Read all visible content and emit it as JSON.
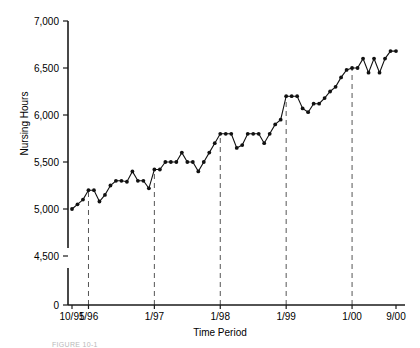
{
  "figure": {
    "caption": "FIGURE 10-1"
  },
  "chart_data": {
    "type": "line",
    "title": "",
    "xlabel": "Time Period",
    "ylabel": "Nursing Hours",
    "grid": false,
    "legend": null,
    "axis_break": true,
    "ylim": [
      4250,
      7000
    ],
    "yticks": [
      0,
      4500,
      5000,
      5500,
      6000,
      6500,
      7000
    ],
    "ytick_labels": [
      "0",
      "4,500",
      "5,000",
      "5,500",
      "6,000",
      "6,500",
      "7,000"
    ],
    "xtick_labels": [
      "10/95",
      "1/96",
      "1/97",
      "1/98",
      "1/99",
      "1/00",
      "9/00"
    ],
    "xtick_index": [
      0,
      3,
      15,
      27,
      39,
      51,
      59
    ],
    "reference_lines": [
      "1/96",
      "1/97",
      "1/98",
      "1/99",
      "1/00"
    ],
    "x": [
      "10/95",
      "11/95",
      "12/95",
      "1/96",
      "2/96",
      "3/96",
      "4/96",
      "5/96",
      "6/96",
      "7/96",
      "8/96",
      "9/96",
      "10/96",
      "11/96",
      "12/96",
      "1/97",
      "2/97",
      "3/97",
      "4/97",
      "5/97",
      "6/97",
      "7/97",
      "8/97",
      "9/97",
      "10/97",
      "11/97",
      "12/97",
      "1/98",
      "2/98",
      "3/98",
      "4/98",
      "5/98",
      "6/98",
      "7/98",
      "8/98",
      "9/98",
      "10/98",
      "11/98",
      "12/98",
      "1/99",
      "2/99",
      "3/99",
      "4/99",
      "5/99",
      "6/99",
      "7/99",
      "8/99",
      "9/99",
      "10/99",
      "11/99",
      "12/99",
      "1/00",
      "2/00",
      "3/00",
      "4/00",
      "5/00",
      "6/00",
      "7/00",
      "8/00",
      "9/00"
    ],
    "values": [
      5000,
      5050,
      5100,
      5200,
      5200,
      5080,
      5150,
      5250,
      5300,
      5300,
      5290,
      5400,
      5300,
      5300,
      5220,
      5420,
      5420,
      5500,
      5500,
      5500,
      5600,
      5500,
      5500,
      5400,
      5500,
      5600,
      5700,
      5800,
      5800,
      5800,
      5650,
      5680,
      5800,
      5800,
      5800,
      5700,
      5800,
      5900,
      5950,
      6200,
      6200,
      6200,
      6070,
      6030,
      6120,
      6120,
      6180,
      6250,
      6300,
      6400,
      6480,
      6500,
      6500,
      6600,
      6450,
      6600,
      6450,
      6600,
      6680,
      6680
    ],
    "series_name": "Nursing Hours"
  }
}
